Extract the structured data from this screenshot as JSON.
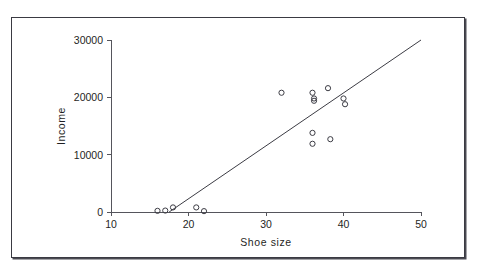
{
  "page": {
    "clipped_header_text": "                                                                                "
  },
  "figure": {
    "frame_color": "#3a3a42",
    "background": "#ffffff"
  },
  "chart_data": {
    "type": "scatter",
    "title": "",
    "xlabel": "Shoe size",
    "ylabel": "Income",
    "xlim": [
      10,
      50
    ],
    "ylim": [
      0,
      30000
    ],
    "xticks": [
      10,
      20,
      30,
      40,
      50
    ],
    "xtick_labels": [
      "10",
      "20",
      "30",
      "40",
      "50"
    ],
    "yticks": [
      0,
      10000,
      20000,
      30000
    ],
    "ytick_labels": [
      "0",
      "10000",
      "20000",
      "30000"
    ],
    "grid": false,
    "legend": null,
    "marker": "open-circle",
    "marker_color": "#3c3c44",
    "series": [
      {
        "name": "observations",
        "points": [
          [
            16.0,
            200
          ],
          [
            17.0,
            250
          ],
          [
            18.0,
            800
          ],
          [
            21.0,
            800
          ],
          [
            22.0,
            150
          ],
          [
            32.0,
            20800
          ],
          [
            36.0,
            20800
          ],
          [
            36.2,
            19800
          ],
          [
            36.2,
            19400
          ],
          [
            36.0,
            13800
          ],
          [
            36.0,
            11900
          ],
          [
            38.0,
            21600
          ],
          [
            38.3,
            12700
          ],
          [
            40.0,
            19800
          ],
          [
            40.2,
            18800
          ]
        ]
      }
    ],
    "annotations": [
      {
        "type": "line",
        "name": "regression-line",
        "x": [
          17.5,
          50.0
        ],
        "y": [
          0,
          30000
        ],
        "color": "#3c3c44"
      }
    ]
  }
}
